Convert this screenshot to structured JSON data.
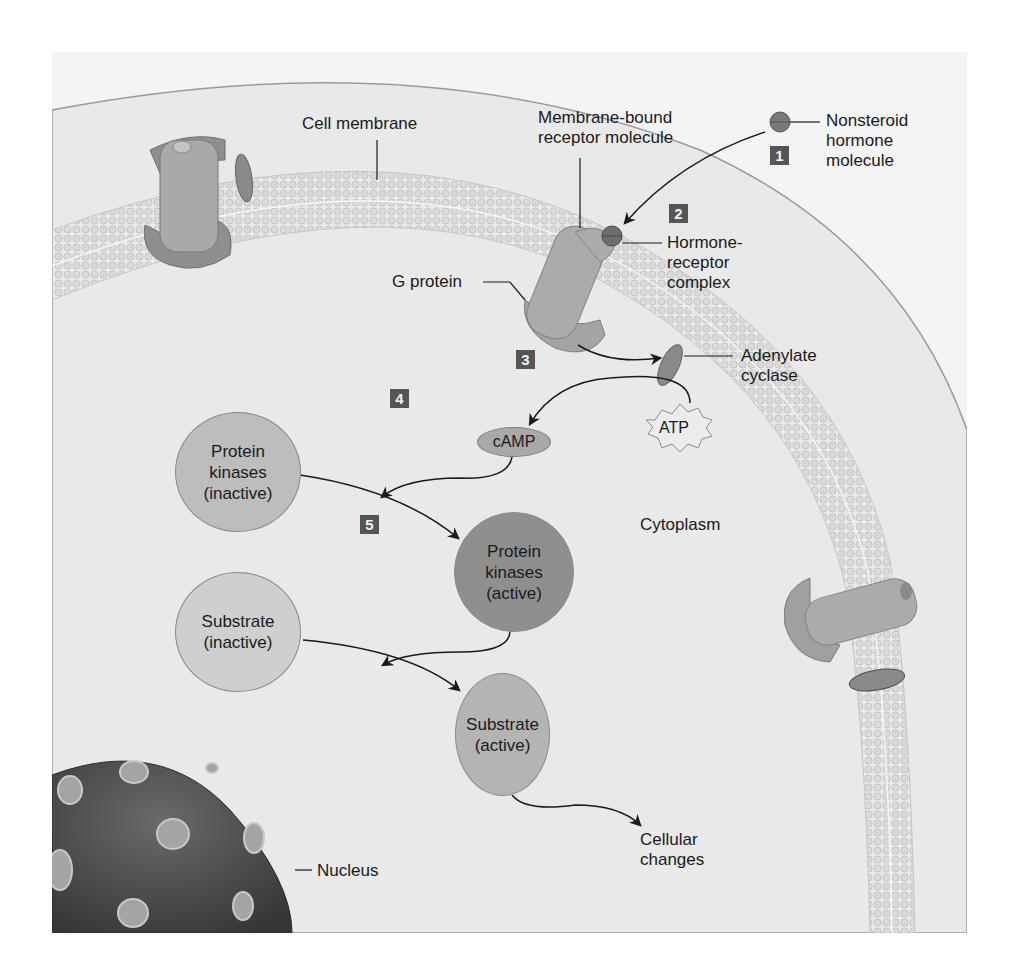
{
  "figure": {
    "type": "nonsteroid hormone signaling pathway (cAMP second messenger)",
    "colors": {
      "background_outside": "#f4f4f4",
      "cytoplasm": "#e9e9e9",
      "membrane": "#d3d3d3",
      "protein": "#a9a9a9",
      "protein_dark": "#8c8c8c",
      "kinase_inactive": "#bdbdbd",
      "kinase_active": "#8f8f8f",
      "substrate_inactive": "#cfcfcf",
      "substrate_active": "#b4b4b4",
      "nucleus": "#4a4a4a",
      "badge": "#555555"
    }
  },
  "labels": {
    "cell_membrane": "Cell membrane",
    "membrane_bound_receptor": "Membrane-bound\nreceptor molecule",
    "nonsteroid_hormone": "Nonsteroid\nhormone\nmolecule",
    "hormone_receptor_complex": "Hormone-\nreceptor\ncomplex",
    "g_protein": "G protein",
    "adenylate_cyclase": "Adenylate\ncyclase",
    "atp": "ATP",
    "camp": "cAMP",
    "cytoplasm": "Cytoplasm",
    "nucleus": "Nucleus",
    "cellular_changes": "Cellular\nchanges"
  },
  "nodes": {
    "protein_kinases_inactive": "Protein\nkinases\n(inactive)",
    "protein_kinases_active": "Protein\nkinases\n(active)",
    "substrate_inactive": "Substrate\n(inactive)",
    "substrate_active": "Substrate\n(active)"
  },
  "steps": [
    "1",
    "2",
    "3",
    "4",
    "5"
  ]
}
